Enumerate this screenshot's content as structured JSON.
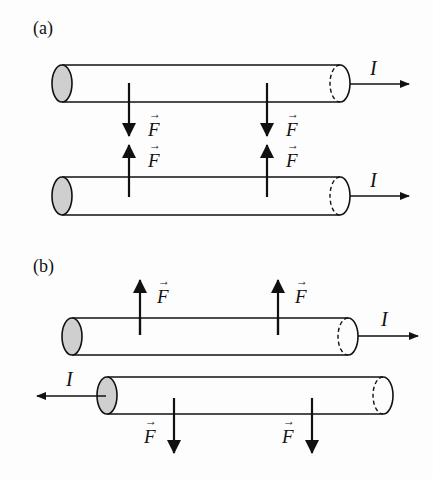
{
  "diagram": {
    "panels": [
      {
        "label": "(a)",
        "description": "Parallel currents in same direction attract",
        "wires": [
          {
            "current_label": "I",
            "current_direction": "right"
          },
          {
            "current_label": "I",
            "current_direction": "right"
          }
        ],
        "forces": [
          {
            "label": "F",
            "direction": "down",
            "on": "top wire"
          },
          {
            "label": "F",
            "direction": "down",
            "on": "top wire"
          },
          {
            "label": "F",
            "direction": "up",
            "on": "bottom wire"
          },
          {
            "label": "F",
            "direction": "up",
            "on": "bottom wire"
          }
        ]
      },
      {
        "label": "(b)",
        "description": "Antiparallel currents repel",
        "wires": [
          {
            "current_label": "I",
            "current_direction": "right"
          },
          {
            "current_label": "I",
            "current_direction": "left"
          }
        ],
        "forces": [
          {
            "label": "F",
            "direction": "up",
            "on": "top wire"
          },
          {
            "label": "F",
            "direction": "up",
            "on": "top wire"
          },
          {
            "label": "F",
            "direction": "down",
            "on": "bottom wire"
          },
          {
            "label": "F",
            "direction": "down",
            "on": "bottom wire"
          }
        ]
      }
    ],
    "colors": {
      "line": "#111111",
      "cap_fill": "#cfcfcf",
      "background": "#fdfdfd"
    }
  }
}
